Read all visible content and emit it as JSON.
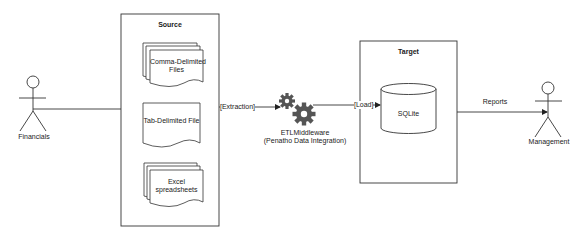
{
  "diagram": {
    "actors": {
      "financials": {
        "label": "Financials"
      },
      "management": {
        "label": "Management"
      }
    },
    "source": {
      "title": "Source",
      "documents": [
        {
          "label_line1": "Comma-Delimited",
          "label_line2": "Files",
          "shape": "multi-document"
        },
        {
          "label_line1": "Tab-Delimited File",
          "label_line2": "",
          "shape": "document"
        },
        {
          "label_line1": "Excel",
          "label_line2": "spreadsheets",
          "shape": "multi-document"
        }
      ]
    },
    "middleware": {
      "label_line1": "ETLMiddleware",
      "label_line2": "(Penatho Data Integration)",
      "icon": "gears-icon",
      "color": "#555555"
    },
    "target": {
      "title": "Target",
      "database": {
        "label": "SQLite",
        "shape": "cylinder"
      }
    },
    "edges": {
      "extraction": "[Extraction]",
      "load": "[Load]",
      "reports": "Reports"
    },
    "colors": {
      "stroke": "#333333",
      "background": "#ffffff"
    }
  }
}
